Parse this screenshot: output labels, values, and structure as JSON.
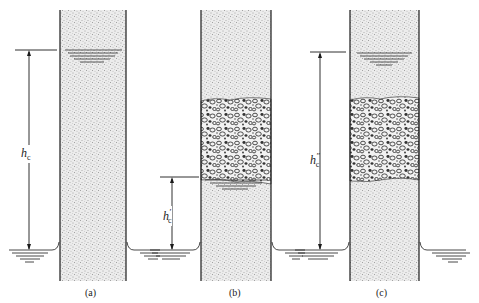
{
  "figure": {
    "panels": [
      {
        "id": "a",
        "caption": "(a)",
        "height_label": "h",
        "height_sub": "c",
        "height_prime": "",
        "has_gravel_layer": false,
        "description": "Uniform fine soil column; capillary water rises to height hc"
      },
      {
        "id": "b",
        "caption": "(b)",
        "height_label": "h",
        "height_sub": "c",
        "height_prime": "′",
        "has_gravel_layer": true,
        "description": "Coarse gravel layer interrupts capillary rise; water stops below gravel at height h'c"
      },
      {
        "id": "c",
        "caption": "(c)",
        "height_label": "h",
        "height_sub": "c",
        "height_prime": "″",
        "has_gravel_layer": true,
        "description": "Gravel layer below capillary fringe; water rises above gravel to height h''c"
      }
    ],
    "colors": {
      "ink": "#1a1a1a",
      "sand_fill": "#e6e6e6",
      "background": "#ffffff"
    }
  }
}
